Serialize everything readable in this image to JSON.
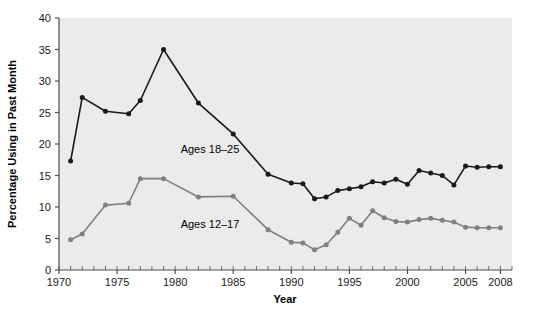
{
  "chart_data": {
    "type": "line",
    "title": "",
    "xlabel": "Year",
    "ylabel": "Percentage Using in Past Month",
    "xlim": [
      1970,
      2009
    ],
    "ylim": [
      0,
      40
    ],
    "ytick_values": [
      0,
      5,
      10,
      15,
      20,
      25,
      30,
      35,
      40
    ],
    "ytick_labels": [
      "0",
      "5",
      "10",
      "15",
      "20",
      "25",
      "30",
      "35",
      "40"
    ],
    "xtick_values": [
      1970,
      1975,
      1980,
      1985,
      1990,
      1995,
      2000,
      2005,
      2008
    ],
    "xtick_labels": [
      "1970",
      "1975",
      "1980",
      "1985",
      "1990",
      "1995",
      "2000",
      "2005",
      "2008"
    ],
    "minor_xticks": "every 1 year",
    "grid": false,
    "legend_position": "inline-annotations",
    "plot_background": "#ebebeb",
    "series": [
      {
        "name": "Ages 18-25",
        "label": "Ages 18–25",
        "color": "#1a1a1a",
        "marker": "circle",
        "annotation_x": 1983.0,
        "annotation_y": 18.6,
        "x": [
          1971,
          1972,
          1974,
          1976,
          1977,
          1979,
          1982,
          1985,
          1988,
          1990,
          1991,
          1992,
          1993,
          1994,
          1995,
          1996,
          1997,
          1998,
          1999,
          2000,
          2001,
          2002,
          2003,
          2004,
          2005,
          2006,
          2007,
          2008
        ],
        "y": [
          17.3,
          27.4,
          25.2,
          24.8,
          26.9,
          35.0,
          26.5,
          21.6,
          15.2,
          13.8,
          13.7,
          11.3,
          11.6,
          12.6,
          12.9,
          13.2,
          14.0,
          13.8,
          14.4,
          13.6,
          15.8,
          15.4,
          15.0,
          13.5,
          16.5,
          16.3,
          16.4,
          16.4
        ]
      },
      {
        "name": "Ages 12-17",
        "label": "Ages 12–17",
        "color": "#808080",
        "marker": "circle",
        "annotation_x": 1983.0,
        "annotation_y": 6.6,
        "x": [
          1971,
          1972,
          1974,
          1976,
          1977,
          1979,
          1982,
          1985,
          1988,
          1990,
          1991,
          1992,
          1993,
          1994,
          1995,
          1996,
          1997,
          1998,
          1999,
          2000,
          2001,
          2002,
          2003,
          2004,
          2005,
          2006,
          2007,
          2008
        ],
        "y": [
          4.8,
          5.7,
          10.3,
          10.6,
          14.5,
          14.5,
          11.6,
          11.7,
          6.4,
          4.4,
          4.3,
          3.2,
          4.0,
          6.0,
          8.2,
          7.1,
          9.4,
          8.3,
          7.7,
          7.6,
          8.0,
          8.2,
          7.9,
          7.6,
          6.8,
          6.7,
          6.7,
          6.7
        ]
      }
    ]
  },
  "axes": {
    "xlabel": "Year",
    "ylabel": "Percentage Using in Past Month"
  }
}
